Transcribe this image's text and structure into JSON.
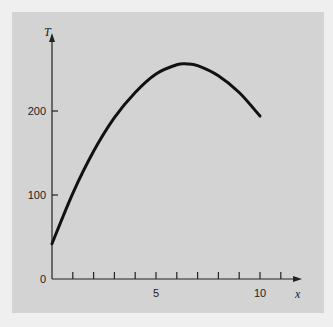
{
  "colors": {
    "outer_bg": "#efefef",
    "panel_bg": "#d3d3d3",
    "line": "#111111",
    "axis": "#222222"
  },
  "chart_data": {
    "type": "line",
    "title": "",
    "xlabel": "x",
    "ylabel": "T",
    "xlim": [
      0,
      11.5
    ],
    "ylim": [
      0,
      290
    ],
    "x_ticks": [
      1,
      2,
      3,
      4,
      5,
      6,
      7,
      8,
      9,
      10,
      11
    ],
    "x_tick_labels": [
      {
        "value": 5,
        "label": "5"
      },
      {
        "value": 10,
        "label": "10"
      }
    ],
    "y_ticks": [
      {
        "value": 0,
        "label": "0"
      },
      {
        "value": 100,
        "label": "100"
      },
      {
        "value": 200,
        "label": "200"
      }
    ],
    "grid": false,
    "legend": null,
    "series": [
      {
        "name": "T(x)",
        "x": [
          0,
          1,
          2,
          3,
          4,
          5,
          6,
          6.5,
          7,
          8,
          9,
          10
        ],
        "values": [
          42,
          102,
          152,
          192,
          222,
          244,
          255,
          256,
          254,
          242,
          222,
          194
        ]
      }
    ]
  }
}
